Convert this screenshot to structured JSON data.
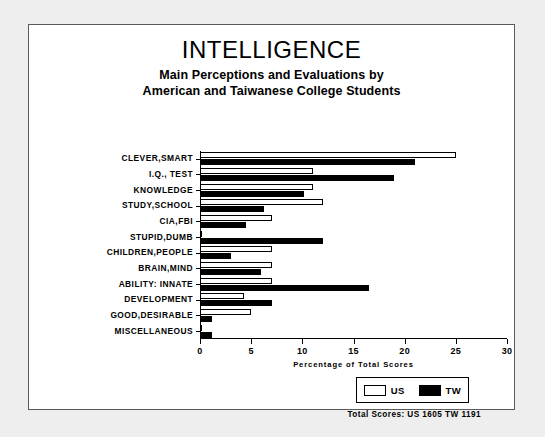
{
  "chart_data": {
    "type": "bar",
    "orientation": "horizontal",
    "title": "INTELLIGENCE",
    "subtitle_line_1": "Main Perceptions and Evaluations by",
    "subtitle_line_2": "American and Taiwanese College Students",
    "xlabel": "Percentage of Total Scores",
    "ylabel": "",
    "xlim": [
      0,
      30
    ],
    "xticks": [
      0,
      5,
      10,
      15,
      20,
      25,
      30
    ],
    "grid": false,
    "legend_position": "bottom-right",
    "categories": [
      "CLEVER,SMART",
      "I.Q., TEST",
      "KNOWLEDGE",
      "STUDY,SCHOOL",
      "CIA,FBI",
      "STUPID,DUMB",
      "CHILDREN,PEOPLE",
      "BRAIN,MIND",
      "ABILITY: INNATE",
      "DEVELOPMENT",
      "GOOD,DESIRABLE",
      "MISCELLANEOUS"
    ],
    "series": [
      {
        "name": "US",
        "color": "#ffffff",
        "edge_color": "#000000",
        "values": [
          25.0,
          11.0,
          11.0,
          12.0,
          7.0,
          0.2,
          7.0,
          7.0,
          7.0,
          4.3,
          5.0,
          0.2
        ]
      },
      {
        "name": "TW",
        "color": "#000000",
        "edge_color": "#000000",
        "values": [
          21.0,
          19.0,
          10.2,
          6.3,
          4.5,
          12.0,
          3.0,
          6.0,
          16.5,
          7.0,
          1.2,
          1.2
        ]
      }
    ],
    "annotations": {
      "totals": "Total Scores:   US 1605   TW 1191"
    }
  },
  "legend": {
    "us_label": "US",
    "tw_label": "TW"
  }
}
